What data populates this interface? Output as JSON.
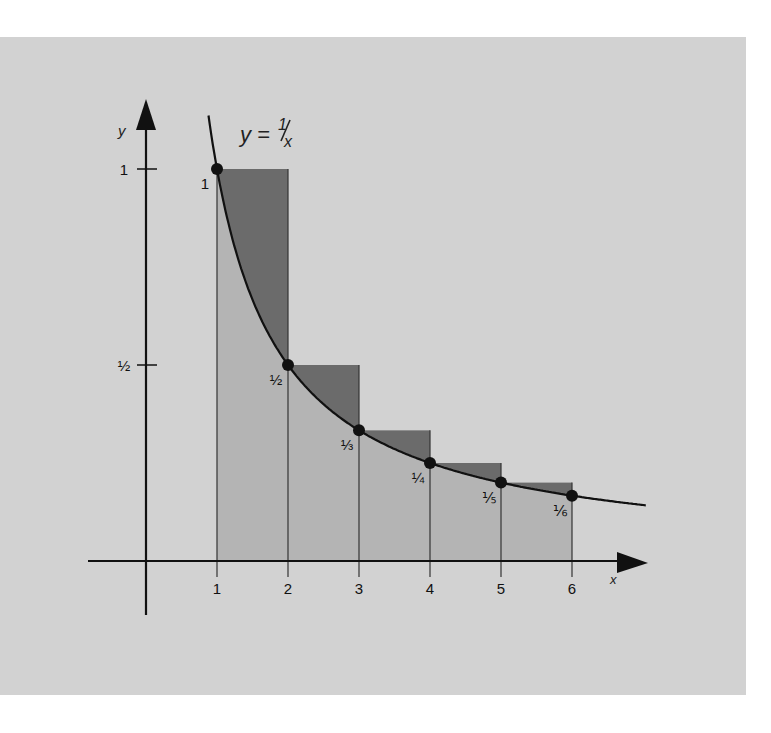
{
  "colors": {
    "background": "#d2d2d2",
    "page": "#ffffff",
    "light_rect": "#b4b4b4",
    "dark_rect": "#6b6b6b",
    "ink": "#111111"
  },
  "diagram": {
    "equation": {
      "lhs": "y",
      "eq": "=",
      "num": "1",
      "den": "x"
    },
    "x_axis_label": "x",
    "y_axis_label": "y",
    "y_ticks": [
      {
        "label": "1",
        "value": 1
      },
      {
        "label": "½",
        "value": 0.5
      }
    ],
    "x_ticks": [
      {
        "label": "1",
        "value": 1
      },
      {
        "label": "2",
        "value": 2
      },
      {
        "label": "3",
        "value": 3
      },
      {
        "label": "4",
        "value": 4
      },
      {
        "label": "5",
        "value": 5
      },
      {
        "label": "6",
        "value": 6
      }
    ],
    "points": [
      {
        "x": 1,
        "y": 1,
        "label": "1"
      },
      {
        "x": 2,
        "y": 0.5,
        "label": "½"
      },
      {
        "x": 3,
        "y": 0.3333,
        "label": "⅓"
      },
      {
        "x": 4,
        "y": 0.25,
        "label": "¼"
      },
      {
        "x": 5,
        "y": 0.2,
        "label": "⅕"
      },
      {
        "x": 6,
        "y": 0.1667,
        "label": "⅙"
      }
    ],
    "rectangles": [
      {
        "x0": 1,
        "x1": 2,
        "height": 1
      },
      {
        "x0": 2,
        "x1": 3,
        "height": 0.5
      },
      {
        "x0": 3,
        "x1": 4,
        "height": 0.3333
      },
      {
        "x0": 4,
        "x1": 5,
        "height": 0.25
      },
      {
        "x0": 5,
        "x1": 6,
        "height": 0.2
      }
    ]
  }
}
